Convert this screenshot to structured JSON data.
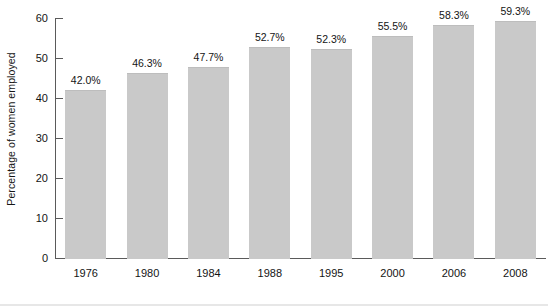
{
  "chart_data": {
    "type": "bar",
    "title": "",
    "xlabel": "",
    "ylabel": "Percentage of women employed",
    "categories": [
      "1976",
      "1980",
      "1984",
      "1988",
      "1995",
      "2000",
      "2006",
      "2008"
    ],
    "values": [
      42.0,
      46.3,
      47.7,
      52.7,
      52.3,
      55.5,
      58.3,
      59.3
    ],
    "data_labels": [
      "42.0%",
      "46.3%",
      "47.7%",
      "52.7%",
      "52.3%",
      "55.5%",
      "58.3%",
      "59.3%"
    ],
    "ylim": [
      0,
      60
    ],
    "y_ticks": [
      0,
      10,
      20,
      30,
      40,
      50,
      60
    ],
    "y_tick_labels": [
      "0",
      "10",
      "20",
      "30",
      "40",
      "50",
      "60"
    ],
    "grid": false,
    "legend": null,
    "legend_position": "none",
    "bar_color": "#c9c9c9",
    "axis_color": "#5a5a5a",
    "text_color": "#141414",
    "background_color": "#ffffff"
  }
}
